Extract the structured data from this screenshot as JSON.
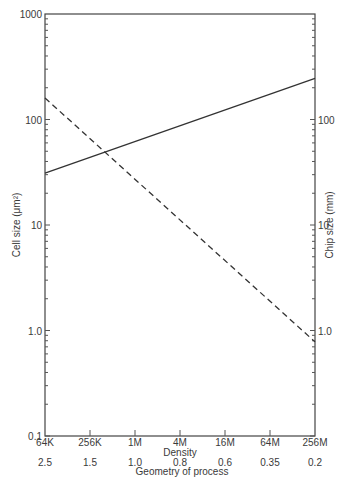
{
  "chart_data": {
    "type": "line",
    "title": "",
    "xlabel": "Density",
    "xlabel_secondary": "Geometry of process",
    "ylabel": "Cell size (μm²)",
    "ylabel_right": "Chip size (mm)",
    "categories": [
      "64K",
      "256K",
      "1M",
      "4M",
      "16M",
      "64M",
      "256M"
    ],
    "secondary_categories": [
      "2.5",
      "1.5",
      "1.0",
      "0.8",
      "0.6",
      "0.35",
      "0.2"
    ],
    "yscale": "log",
    "ylim": [
      0.1,
      1000
    ],
    "ylim_right": [
      0.1,
      1000
    ],
    "yticks_left": [
      "0.1",
      "1.0",
      "10",
      "100",
      "1000"
    ],
    "yticks_right": [
      "1.0",
      "10",
      "100"
    ],
    "grid": false,
    "series": [
      {
        "name": "Chip size (mm)",
        "style": "solid",
        "axis": "right",
        "x": [
          "64K",
          "256M"
        ],
        "values": [
          31,
          245
        ]
      },
      {
        "name": "Cell size (μm²)",
        "style": "dashed",
        "axis": "left",
        "x": [
          "64K",
          "256M"
        ],
        "values": [
          160,
          0.78
        ]
      }
    ]
  }
}
